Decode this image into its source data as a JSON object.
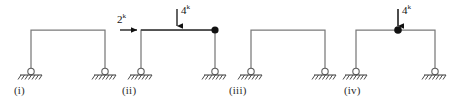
{
  "diagram": {
    "line_color": "#7a7a7a",
    "load_color": "#111111",
    "ground_color": "#4a4a4a",
    "frames": [
      {
        "id": "frame-i",
        "caption": "(i)",
        "caption_x": 14,
        "caption_y": 84,
        "left_column_x": 31,
        "right_column_x": 105,
        "beam_y": 30,
        "base_y": 69,
        "supports": [
          "pin",
          "pin"
        ],
        "joint_marker": "none",
        "loads": []
      },
      {
        "id": "frame-ii",
        "caption": "(ii)",
        "caption_x": 122,
        "caption_y": 84,
        "left_column_x": 141,
        "right_column_x": 215,
        "beam_y": 30,
        "base_y": 69,
        "supports": [
          "pin",
          "pin"
        ],
        "joint_marker": "filled-circle-right",
        "loads": [
          {
            "type": "horizontal",
            "magnitude": "2",
            "exponent": "k",
            "label_x": 119,
            "label_y": 13,
            "arrow_from_x": 120,
            "arrow_to_x": 141,
            "arrow_y": 30,
            "direction": "right"
          },
          {
            "type": "vertical",
            "magnitude": "4",
            "exponent": "k",
            "label_x": 182,
            "label_y": 4,
            "arrow_x": 177,
            "arrow_from_y": 8,
            "arrow_to_y": 30,
            "direction": "down"
          }
        ]
      },
      {
        "id": "frame-iii",
        "caption": "(iii)",
        "caption_x": 229,
        "caption_y": 84,
        "left_column_x": 251,
        "right_column_x": 325,
        "beam_y": 30,
        "base_y": 69,
        "supports": [
          "pin",
          "pin"
        ],
        "joint_marker": "none",
        "loads": []
      },
      {
        "id": "frame-iv",
        "caption": "(iv)",
        "caption_x": 344,
        "caption_y": 84,
        "left_column_x": 356,
        "right_column_x": 435,
        "beam_y": 30,
        "base_y": 69,
        "supports": [
          "pin",
          "pin"
        ],
        "joint_marker": "filled-circle-mid",
        "joint_x": 398,
        "loads": [
          {
            "type": "vertical",
            "magnitude": "4",
            "exponent": "k",
            "label_x": 402,
            "label_y": 4,
            "arrow_x": 398,
            "arrow_from_y": 8,
            "arrow_to_y": 30,
            "direction": "down"
          }
        ]
      }
    ],
    "support_symbol": {
      "name": "pin-support",
      "circle_radius": 3.2,
      "ground_half_width": 11,
      "hatch_count": 7
    }
  }
}
